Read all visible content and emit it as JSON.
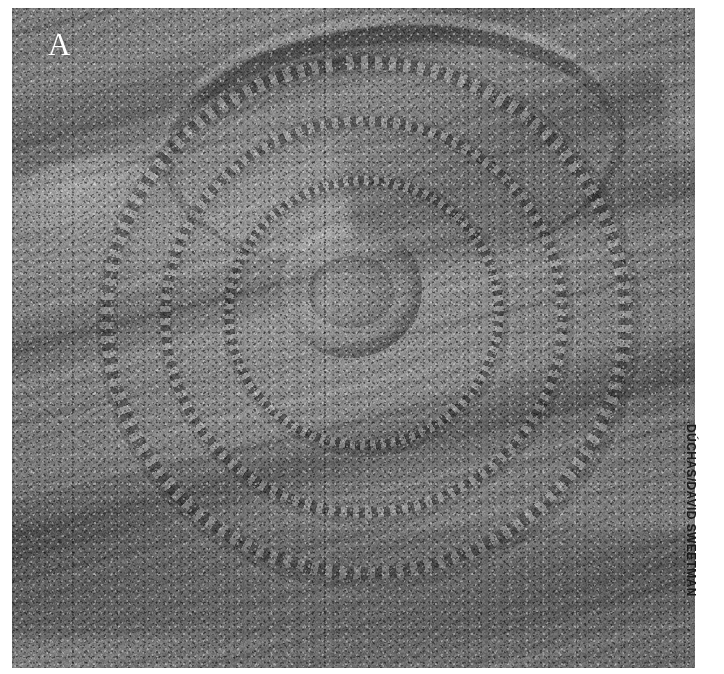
{
  "figure": {
    "panel_label": "A",
    "photo_credit": "DÚCHAS/DAVID SWEETMAN",
    "medium": "grayscale-photograph",
    "colors": {
      "page_background": "#ffffff",
      "rock_midtone": "#8b8b8b",
      "rock_highlight": "#c9c9c9",
      "rock_shadow": "#4a4a4a",
      "label_text": "#ffffff",
      "credit_text": "#1a1a1a"
    }
  }
}
